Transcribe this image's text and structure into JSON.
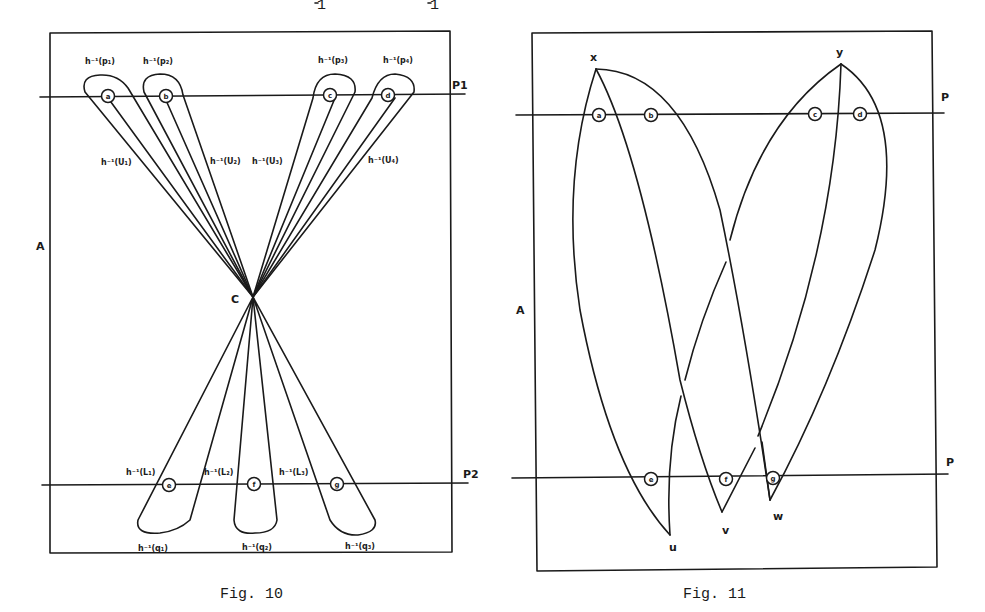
{
  "header_fragment": [
    "1",
    "1"
  ],
  "fig10": {
    "caption": "Fig. 10",
    "region_label": "A",
    "center_label": "C",
    "line_labels": [
      "P1",
      "P2"
    ],
    "top_points": [
      "a",
      "b",
      "c",
      "d"
    ],
    "bottom_points": [
      "e",
      "f",
      "g"
    ],
    "top_preimage_labels": [
      "h⁻¹(p₁)",
      "h⁻¹(p₂)",
      "h⁻¹(p₃)",
      "h⁻¹(p₄)"
    ],
    "upper_set_labels": [
      "h⁻¹(U₁)",
      "h⁻¹(U₂)",
      "h⁻¹(U₃)",
      "h⁻¹(U₄)"
    ],
    "lower_set_labels": [
      "h⁻¹(L₁)",
      "h⁻¹(L₂)",
      "h⁻¹(L₃)"
    ],
    "bottom_preimage_labels": [
      "h⁻¹(q₁)",
      "h⁻¹(q₂)",
      "h⁻¹(q₃)"
    ]
  },
  "fig11": {
    "caption": "Fig. 11",
    "region_label": "A",
    "line_labels": [
      "P",
      "P"
    ],
    "top_points": [
      "a",
      "b",
      "c",
      "d"
    ],
    "bottom_points": [
      "e",
      "f",
      "g"
    ],
    "vertex_labels": [
      "x",
      "y",
      "u",
      "v",
      "w"
    ]
  }
}
